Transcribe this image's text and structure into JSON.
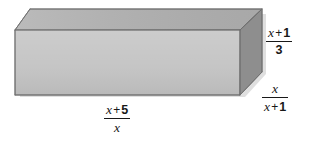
{
  "figure": {
    "shape_name": "rectangular-prism",
    "background_color": "#ffffff",
    "faces": {
      "top": {
        "name": "top-face",
        "fill": "#b3b3b3"
      },
      "front": {
        "name": "front-face",
        "fill": "#c3c3c3"
      },
      "right": {
        "name": "right-face",
        "fill": "#8e8e8e"
      }
    },
    "edge_color": "#6f6f6f",
    "shadow_color": "#d9d9d9"
  },
  "labels": {
    "height": {
      "name": "height-label",
      "numerator_var": "x",
      "numerator_op": "+",
      "numerator_const": "1",
      "denominator": "3",
      "plain": "(x + 1)/3"
    },
    "depth": {
      "name": "depth-label",
      "numerator": "x",
      "denominator_var": "x",
      "denominator_op": "+",
      "denominator_const": "1",
      "plain": "x/(x + 1)"
    },
    "width": {
      "name": "width-label",
      "numerator_var": "x",
      "numerator_op": "+",
      "numerator_const": "5",
      "denominator": "x",
      "plain": "(x + 5)/x"
    }
  }
}
